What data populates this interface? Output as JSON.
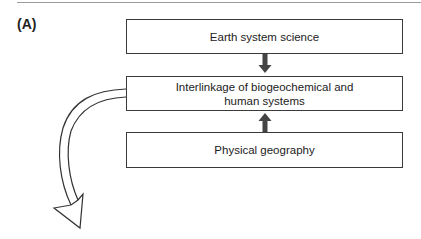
{
  "figure": {
    "panel_label": "(A)",
    "boxes": [
      {
        "id": "earth-system-science",
        "label": "Earth system science"
      },
      {
        "id": "interlinkage",
        "label": "Interlinkage of biogeochemical and\nhuman systems"
      },
      {
        "id": "physical-geography",
        "label": "Physical geography"
      }
    ],
    "arrows": [
      {
        "from": "earth-system-science",
        "to": "interlinkage",
        "style": "solid-down"
      },
      {
        "from": "physical-geography",
        "to": "interlinkage",
        "style": "solid-up"
      },
      {
        "from": "interlinkage",
        "to": "offscreen-below-left",
        "style": "hollow-curved"
      }
    ],
    "colors": {
      "stroke": "#3a3a3a",
      "arrow_fill": "#444444",
      "rule": "#9a9a9a"
    }
  }
}
